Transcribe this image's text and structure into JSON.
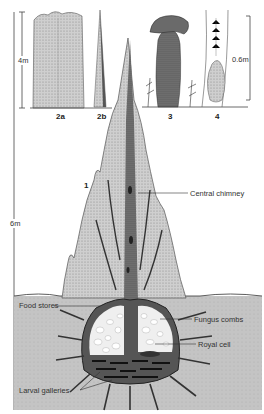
{
  "figures": {
    "fig_2a": "2a",
    "fig_2b": "2b",
    "fig_3": "3",
    "fig_4": "4",
    "fig_1": "1"
  },
  "scales": {
    "left_top": "4m",
    "right_top": "0.6m",
    "main": "6m"
  },
  "labels": {
    "central_chimney": "Central chimney",
    "food_stores": "Food stores",
    "fungus_combs": "Fungus combs",
    "royal_cell": "Royal cell",
    "larval_galleries": "Larval galleries"
  },
  "colors": {
    "mound_fill": "#c9c9c9",
    "mound_dark": "#5a5a5a",
    "soil": "#bdbdbd",
    "line": "#333333",
    "cell_white": "#ffffff"
  }
}
